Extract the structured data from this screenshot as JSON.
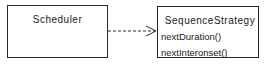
{
  "diagram": {
    "type": "uml-class-dependency",
    "classes": [
      {
        "name": "Scheduler",
        "methods": []
      },
      {
        "name": "SequenceStrategy",
        "methods": [
          "nextDuration()",
          "nextInteronset()"
        ]
      }
    ],
    "relations": [
      {
        "from": "Scheduler",
        "to": "SequenceStrategy",
        "style": "dashed",
        "arrowhead": "open"
      }
    ],
    "colors": {
      "line": "#2a2a2a",
      "background": "#ffffff",
      "text": "#1a1a1a"
    }
  }
}
